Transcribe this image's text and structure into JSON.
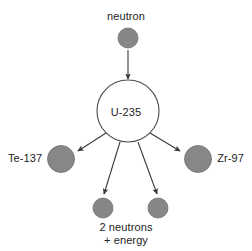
{
  "diagram": {
    "colors": {
      "background": "#ffffff",
      "particle_fill": "#878787",
      "particle_stroke": "#6e6e6e",
      "nucleus_fill": "#ffffff",
      "nucleus_stroke": "#4a4a4a",
      "arrow": "#3a3a3a",
      "text": "#232323"
    },
    "labels": {
      "neutron": "neutron",
      "nucleus": "U-235",
      "fragment_left": "Te-137",
      "fragment_right": "Zr-97",
      "products_line1": "2 neutrons",
      "products_line2": "+ energy"
    },
    "nodes": [
      {
        "name": "incoming-neutron",
        "label": "neutron",
        "shape": "filled-circle",
        "cx": 128,
        "cy": 38,
        "r": 10
      },
      {
        "name": "u235-nucleus",
        "label": "U-235",
        "shape": "outlined-circle",
        "cx": 128,
        "cy": 111,
        "r": 31
      },
      {
        "name": "te137-fragment",
        "label": "Te-137",
        "shape": "filled-circle",
        "cx": 61,
        "cy": 159,
        "r": 13
      },
      {
        "name": "zr97-fragment",
        "label": "Zr-97",
        "shape": "filled-circle",
        "cx": 198,
        "cy": 159,
        "r": 13
      },
      {
        "name": "product-neutron-left",
        "label": "2 neutrons",
        "shape": "filled-circle",
        "cx": 103,
        "cy": 208,
        "r": 10
      },
      {
        "name": "product-neutron-right",
        "label": "2 neutrons",
        "shape": "filled-circle",
        "cx": 158,
        "cy": 208,
        "r": 10
      }
    ],
    "arrows": [
      {
        "name": "arrow-neutron-to-nucleus",
        "from": "incoming-neutron",
        "to": "u235-nucleus",
        "x1": 128,
        "y1": 50,
        "x2": 128,
        "y2": 79
      },
      {
        "name": "arrow-nucleus-to-te137",
        "from": "u235-nucleus",
        "to": "te137-fragment",
        "x1": 106,
        "y1": 133,
        "x2": 77,
        "y2": 152
      },
      {
        "name": "arrow-nucleus-to-zr97",
        "from": "u235-nucleus",
        "to": "zr97-fragment",
        "x1": 150,
        "y1": 133,
        "x2": 181,
        "y2": 152
      },
      {
        "name": "arrow-nucleus-to-neutron-left",
        "from": "u235-nucleus",
        "to": "product-neutron-left",
        "x1": 120,
        "y1": 142,
        "x2": 104,
        "y2": 195
      },
      {
        "name": "arrow-nucleus-to-neutron-right",
        "from": "u235-nucleus",
        "to": "product-neutron-right",
        "x1": 138,
        "y1": 142,
        "x2": 156,
        "y2": 195
      }
    ]
  }
}
